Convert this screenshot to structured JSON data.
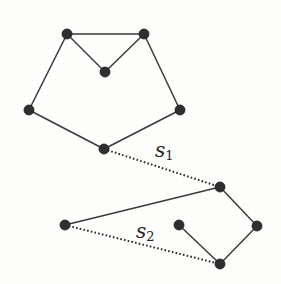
{
  "diagram": {
    "type": "graph",
    "colors": {
      "edge": "#3a3a3a",
      "node": "#2f2f2f",
      "background": "#fdfdfc"
    },
    "nodes": [
      {
        "id": "a",
        "x": 67,
        "y": 34
      },
      {
        "id": "b",
        "x": 144,
        "y": 34
      },
      {
        "id": "c",
        "x": 105,
        "y": 72
      },
      {
        "id": "d",
        "x": 29,
        "y": 110
      },
      {
        "id": "e",
        "x": 180,
        "y": 110
      },
      {
        "id": "f",
        "x": 104,
        "y": 149
      },
      {
        "id": "g",
        "x": 220,
        "y": 187
      },
      {
        "id": "h",
        "x": 257,
        "y": 226
      },
      {
        "id": "i",
        "x": 179,
        "y": 225
      },
      {
        "id": "j",
        "x": 220,
        "y": 264
      },
      {
        "id": "k",
        "x": 65,
        "y": 225
      }
    ],
    "edges": [
      {
        "from": "a",
        "to": "b",
        "style": "solid"
      },
      {
        "from": "a",
        "to": "c",
        "style": "solid"
      },
      {
        "from": "b",
        "to": "c",
        "style": "solid"
      },
      {
        "from": "a",
        "to": "d",
        "style": "solid"
      },
      {
        "from": "b",
        "to": "e",
        "style": "solid"
      },
      {
        "from": "d",
        "to": "f",
        "style": "solid"
      },
      {
        "from": "e",
        "to": "f",
        "style": "solid"
      },
      {
        "from": "k",
        "to": "g",
        "style": "solid"
      },
      {
        "from": "g",
        "to": "h",
        "style": "solid"
      },
      {
        "from": "h",
        "to": "j",
        "style": "solid"
      },
      {
        "from": "i",
        "to": "j",
        "style": "solid"
      },
      {
        "from": "f",
        "to": "g",
        "style": "dotted",
        "label": "s1"
      },
      {
        "from": "k",
        "to": "j",
        "style": "dotted",
        "label": "s2"
      }
    ],
    "labels": [
      {
        "id": "s1",
        "base": "s",
        "sub": "1",
        "x": 155,
        "y": 140
      },
      {
        "id": "s2",
        "base": "s",
        "sub": "2",
        "x": 136,
        "y": 221
      }
    ]
  }
}
